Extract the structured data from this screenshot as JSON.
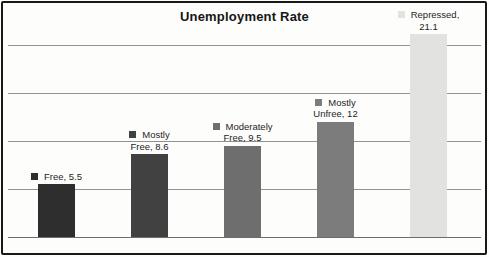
{
  "title": "Unemployment Rate",
  "chart_data": {
    "type": "bar",
    "title": "Unemployment Rate",
    "categories": [
      "Free",
      "Mostly Free",
      "Moderately Free",
      "Mostly Unfree",
      "Repressed"
    ],
    "values": [
      5.5,
      8.6,
      9.5,
      12,
      21.1
    ],
    "data_labels": [
      {
        "lines": [
          "Free, 5.5"
        ]
      },
      {
        "lines": [
          "Mostly",
          "Free, 8.6"
        ]
      },
      {
        "lines": [
          "Moderately",
          "Free, 9.5"
        ]
      },
      {
        "lines": [
          "Mostly",
          "Unfree, 12"
        ]
      },
      {
        "lines": [
          "Repressed,",
          "21.1"
        ]
      }
    ],
    "bar_colors": [
      "#2e2e2e",
      "#414141",
      "#6e6e6e",
      "#7c7c7c",
      "#e2e2e1"
    ],
    "xlabel": "",
    "ylabel": "",
    "ylim": [
      0,
      23.7
    ],
    "gridline_values": [
      5,
      10,
      15,
      20
    ],
    "grid": "on",
    "legend": "none"
  },
  "colors": {
    "gridline": "#929292",
    "axis": "#6d6d6d",
    "border": "#181818",
    "background": "#fdfdfc",
    "text": "#1d1d1d"
  }
}
